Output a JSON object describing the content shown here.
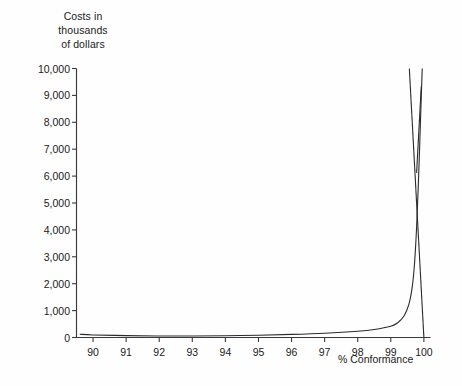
{
  "chart_data": {
    "type": "line",
    "title": "",
    "ylabel": "Costs in thousands of dollars",
    "ylabel_lines": [
      "Costs in",
      "thousands",
      "of dollars"
    ],
    "xlabel": "% Conformance",
    "xlim": [
      89.5,
      100.2
    ],
    "ylim": [
      0,
      10000
    ],
    "grid": false,
    "legend": "none",
    "x_ticks": [
      90,
      91,
      92,
      93,
      94,
      95,
      96,
      97,
      98,
      99,
      100
    ],
    "x_tick_labels": [
      "90",
      "91",
      "92",
      "93",
      "94",
      "95",
      "96",
      "97",
      "98",
      "99",
      "100"
    ],
    "y_ticks": [
      0,
      1000,
      2000,
      3000,
      4000,
      5000,
      6000,
      7000,
      8000,
      9000,
      10000
    ],
    "y_tick_labels": [
      "0",
      "1,000",
      "2,000",
      "3,000",
      "4,000",
      "5,000",
      "6,000",
      "7,000",
      "8,000",
      "9,000",
      "10,000"
    ],
    "series": [
      {
        "name": "cost-of-conformance",
        "type": "exponential-rise",
        "color": "#2b2b2b",
        "points": [
          [
            89.6,
            120
          ],
          [
            90,
            95
          ],
          [
            91,
            70
          ],
          [
            92,
            55
          ],
          [
            93,
            55
          ],
          [
            94,
            65
          ],
          [
            95,
            85
          ],
          [
            96,
            115
          ],
          [
            97,
            160
          ],
          [
            98,
            235
          ],
          [
            98.5,
            300
          ],
          [
            99,
            420
          ],
          [
            99.2,
            540
          ],
          [
            99.4,
            800
          ],
          [
            99.55,
            1250
          ],
          [
            99.65,
            1900
          ],
          [
            99.72,
            2800
          ],
          [
            99.78,
            4100
          ],
          [
            99.83,
            5600
          ],
          [
            99.88,
            7400
          ],
          [
            99.92,
            8900
          ],
          [
            99.95,
            10000
          ]
        ]
      },
      {
        "name": "cost-of-nonconformance",
        "type": "straight-descending",
        "color": "#2b2b2b",
        "points": [
          [
            99.56,
            10000
          ],
          [
            100.0,
            0
          ]
        ]
      },
      {
        "name": "total-cost",
        "type": "straight-short",
        "color": "#2b2b2b",
        "points": [
          [
            99.92,
            9330
          ],
          [
            99.78,
            6120
          ]
        ]
      }
    ]
  },
  "axes": {
    "y_caption_l1": "Costs in",
    "y_caption_l2": "thousands",
    "y_caption_l3": "of dollars",
    "x_caption": "% Conformance"
  },
  "y_labels": [
    "10,000",
    "9,000",
    "8,000",
    "7,000",
    "6,000",
    "5,000",
    "4,000",
    "3,000",
    "2,000",
    "1,000",
    "0"
  ],
  "x_labels": [
    "90",
    "91",
    "92",
    "93",
    "94",
    "95",
    "96",
    "97",
    "98",
    "99",
    "100"
  ],
  "colors": {
    "background": "#fefefe",
    "axis": "#3a3a3a",
    "curve": "#2b2b2b",
    "text": "#1b1b1b"
  }
}
